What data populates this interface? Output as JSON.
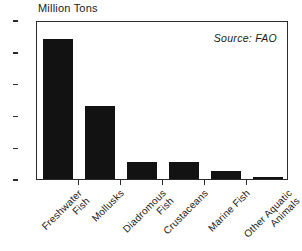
{
  "chart_data": {
    "type": "bar",
    "title": "",
    "ylabel": "Million Tons",
    "xlabel": "",
    "ylim": [
      0,
      20
    ],
    "yticks": [
      0,
      4,
      8,
      12,
      16,
      20
    ],
    "grid": false,
    "legend": "none",
    "annotation": "Source: FAO",
    "bar_color": "#121212",
    "axis_color": "#2b2b2b",
    "categories": [
      "Freshwater\nFish",
      "Mollusks",
      "Diadromous\nFish",
      "Crustaceans",
      "Marine Fish",
      "Other Aquatic\nAnimals"
    ],
    "values": [
      17.6,
      9.2,
      2.2,
      2.2,
      1.0,
      0.3
    ]
  },
  "labels": {
    "y_axis_title": "Million Tons",
    "source": "Source: FAO",
    "y0": "0",
    "y1": "4",
    "y2": "8",
    "y3": "12",
    "y4": "16",
    "y5": "20",
    "cat0": "Freshwater\nFish",
    "cat1": "Mollusks",
    "cat2": "Diadromous\nFish",
    "cat3": "Crustaceans",
    "cat4": "Marine Fish",
    "cat5": "Other Aquatic\nAnimals"
  }
}
